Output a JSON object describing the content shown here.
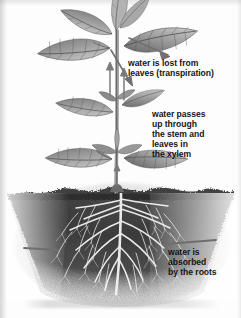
{
  "figure": {
    "width": 241,
    "height": 318,
    "background_color": "#fdfdfd",
    "ink_color": "#151515"
  },
  "annotations": [
    {
      "id": "transpiration",
      "text": "water is lost from\nleaves (transpiration)",
      "pointer": "arrow",
      "pointer_direction": "down-right",
      "target": "leaves"
    },
    {
      "id": "xylem",
      "text": "water passes\nup through\nthe stem and\nleaves in\nthe xylem",
      "pointer": "arrow",
      "pointer_direction": "up",
      "target": "stem"
    },
    {
      "id": "absorbed",
      "text": "water is\nabsorbed\nby the roots",
      "pointer": "line",
      "pointer_direction": "horizontal",
      "target": "roots"
    }
  ],
  "illustration": {
    "style": "graphite-pencil-sketch",
    "parts": [
      {
        "name": "leaves",
        "label": "serrated compound leaves",
        "shade": "#8a8a8a"
      },
      {
        "name": "stem",
        "label": "upright central stem",
        "shade": "#6f6f6f"
      },
      {
        "name": "soil",
        "label": "dark soil mass",
        "shade": "#3b3b3b"
      },
      {
        "name": "roots",
        "label": "branching fibrous root system",
        "shade": "#f2f2f2"
      }
    ],
    "soil_line_y": 193,
    "arrow_color": "#6b6b6b"
  },
  "watermark": {
    "present": true,
    "legible": false,
    "description": "faint illegible caption strip at bottom"
  }
}
